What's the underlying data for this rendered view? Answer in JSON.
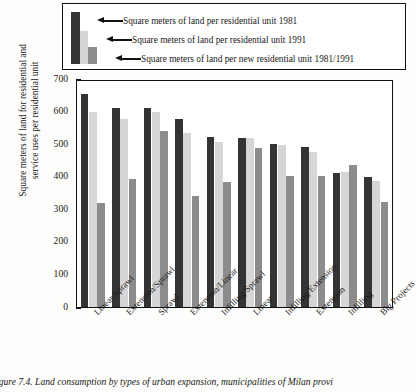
{
  "legend": {
    "items": [
      {
        "label": "Square meters of land per residential unit 1981",
        "swatch": "dark-bar-swatch",
        "color": "#343434"
      },
      {
        "label": "Square meters of land per residential unit 1991",
        "swatch": "light-bar-swatch",
        "color": "#d6d6d6"
      },
      {
        "label": "Square meters of land per new residential unit 1981/1991",
        "swatch": "medium-bar-swatch",
        "color": "#8c8c8c"
      }
    ]
  },
  "axis": {
    "ylabel": "Square meters of land for residential and service uses per residential unit",
    "yticks": [
      "700",
      "600",
      "500",
      "400",
      "300",
      "200",
      "100",
      "0"
    ]
  },
  "caption": "igure 7.4.  Land consumption by types of urban expansion, municipalities of Milan provi",
  "chart_data": {
    "type": "bar",
    "title": "",
    "xlabel": "",
    "ylabel": "Square meters of land for residential and service uses per residential unit",
    "ylim": [
      0,
      700
    ],
    "ytick_step": 100,
    "grid": false,
    "legend_position": "top",
    "categories": [
      "Linear/Sprawl",
      "Extension/Sprawl",
      "Sprawl",
      "Extension/Linear",
      "Infilling/Sprawl",
      "Linear",
      "Infilling/Extension",
      "Extension",
      "Infilling",
      "Big Projects"
    ],
    "series": [
      {
        "name": "Square meters of land per residential unit 1981",
        "color": "#343434",
        "values": [
          655,
          612,
          612,
          578,
          522,
          520,
          502,
          490,
          410,
          398
        ]
      },
      {
        "name": "Square meters of land per residential unit 1991",
        "color": "#d6d6d6",
        "values": [
          600,
          578,
          600,
          535,
          508,
          518,
          498,
          475,
          415,
          388
        ]
      },
      {
        "name": "Square meters of land per new residential unit 1981/1991",
        "color": "#8c8c8c",
        "values": [
          320,
          392,
          540,
          340,
          385,
          488,
          403,
          403,
          437,
          322
        ]
      }
    ]
  }
}
